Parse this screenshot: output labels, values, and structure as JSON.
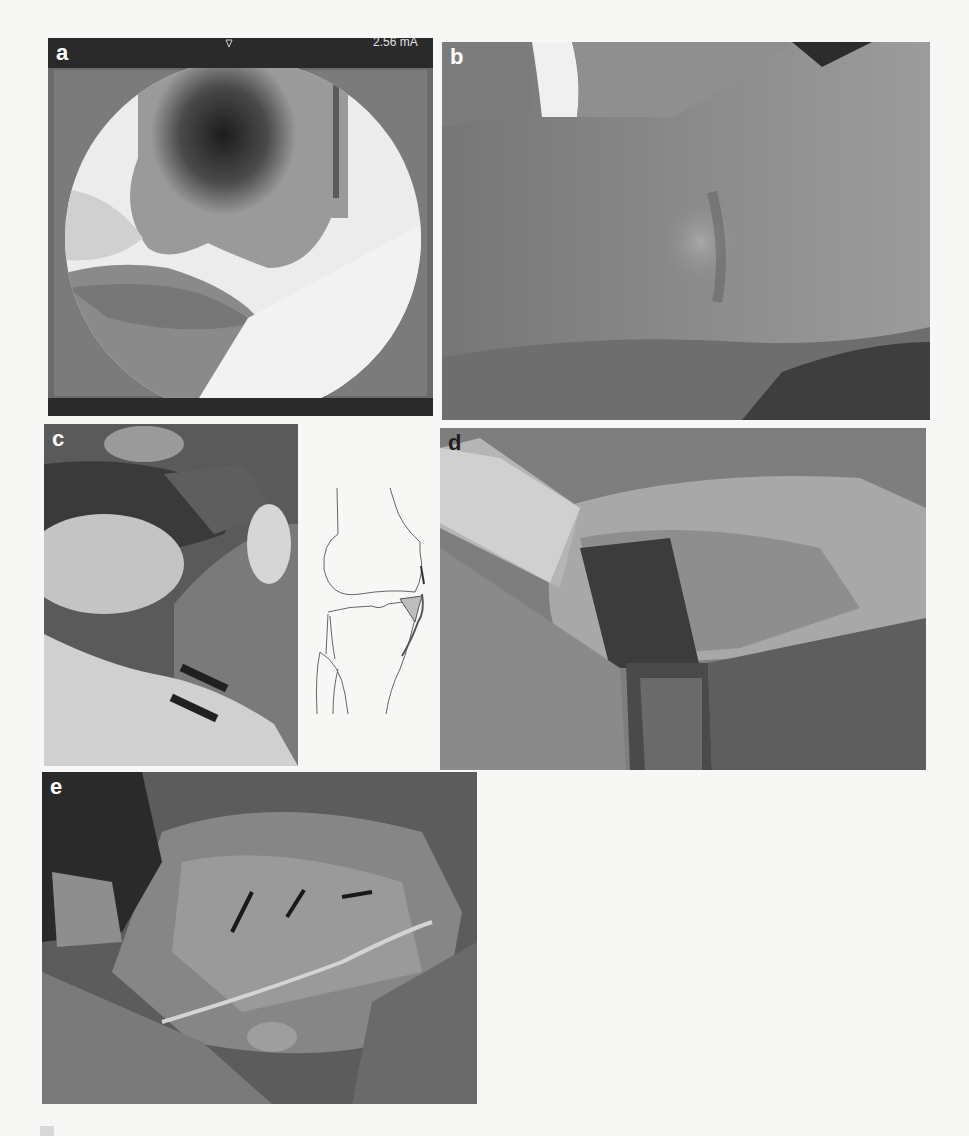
{
  "figure": {
    "panels": [
      {
        "id": "a",
        "label": "a",
        "content": "intraoperative fluoroscopy image of knee (lateral view)",
        "overlay_text": "2.56 mA"
      },
      {
        "id": "b",
        "label": "b",
        "content": "clinical photograph of lateral knee with visible swelling"
      },
      {
        "id": "c",
        "label": "c",
        "content": "intraoperative photograph with anatomical knee line drawing",
        "diagram": "knee joint schematic showing femur, tibia, fibula and highlighted lateral structure"
      },
      {
        "id": "d",
        "label": "d",
        "content": "surgical exposure with retractors"
      },
      {
        "id": "e",
        "label": "e",
        "content": "surgical field after suturing"
      }
    ]
  }
}
